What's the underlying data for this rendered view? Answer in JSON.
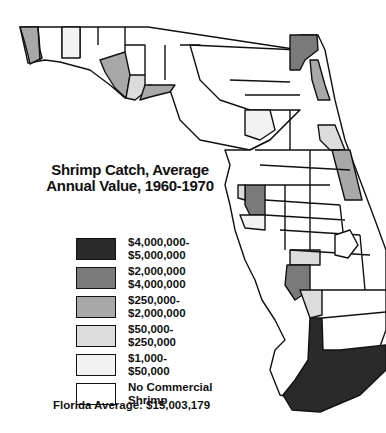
{
  "title": "Shrimp Catch, Average\nAnnual Value, 1960-1970",
  "title_line1": "Shrimp Catch, Average",
  "title_line2": "Annual Value, 1960-1970",
  "legend": [
    {
      "label": "$4,000,000-\n$5,000,000",
      "color": "#2a2a2a"
    },
    {
      "label": "$2,000,000\n$4,000,000",
      "color": "#7a7a7a"
    },
    {
      "label": "$250,000-\n$2,000,000",
      "color": "#a8a8a8"
    },
    {
      "label": "$50,000-\n$250,000",
      "color": "#dcdcdc"
    },
    {
      "label": "$1,000-\n$50,000",
      "color": "#f2f2f2"
    },
    {
      "label": "No Commercial\nShrimp",
      "color": "#ffffff"
    }
  ],
  "florida_average": "Florida Average: $15,003,179"
}
